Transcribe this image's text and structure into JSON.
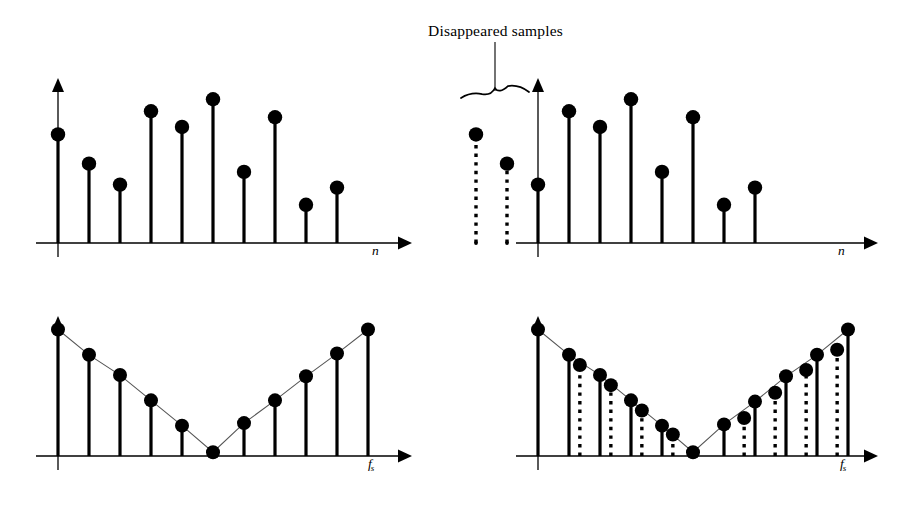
{
  "figure": {
    "background": "#ffffff",
    "ink": "#000000",
    "envelope_color": "#555555"
  },
  "annotations": {
    "disappeared_label": "Disappeared samples",
    "leader_line": {
      "x": 495,
      "y_top": 42,
      "y_bottom": 88
    },
    "brace": {
      "x_left": 461,
      "x_right": 529,
      "y": 98,
      "style": "horizontal-curly-underbrace"
    }
  },
  "axes": {
    "time_label": "n",
    "freq_label_base": "f",
    "freq_label_sub": "s"
  },
  "chart_data": [
    {
      "id": "top-left",
      "type": "stem",
      "title": "Original sampled sequence",
      "xlabel": "n",
      "ylabel": "",
      "origin": {
        "x": 58,
        "y": 243
      },
      "axis_end_x": 392,
      "y_axis_top": 82,
      "spacing": 31,
      "ylim": [
        0,
        1
      ],
      "grid": false,
      "legend": null,
      "categories": [
        0,
        1,
        2,
        3,
        4,
        5,
        6,
        7,
        8,
        9
      ],
      "values": [
        0.725,
        0.53,
        0.39,
        0.88,
        0.775,
        0.96,
        0.475,
        0.84,
        0.255,
        0.37
      ],
      "styles": [
        "solid",
        "solid",
        "solid",
        "solid",
        "solid",
        "solid",
        "solid",
        "solid",
        "solid",
        "solid"
      ]
    },
    {
      "id": "top-right",
      "type": "stem",
      "title": "Sequence with the first two samples disappeared",
      "xlabel": "n",
      "ylabel": "",
      "origin": {
        "x": 538,
        "y": 243
      },
      "axis_end_x": 858,
      "y_axis_top": 82,
      "spacing": 31,
      "ylim": [
        0,
        1
      ],
      "grid": false,
      "legend": null,
      "categories": [
        -2,
        -1,
        0,
        1,
        2,
        3,
        4,
        5,
        6,
        7
      ],
      "values": [
        0.725,
        0.53,
        0.39,
        0.88,
        0.775,
        0.96,
        0.475,
        0.84,
        0.255,
        0.37
      ],
      "styles": [
        "dotted",
        "dotted",
        "solid",
        "solid",
        "solid",
        "solid",
        "solid",
        "solid",
        "solid",
        "solid"
      ],
      "note": "The two left-most stems are drawn dotted — these are the disappeared samples."
    },
    {
      "id": "bottom-left",
      "type": "stem",
      "title": "Spectrum of the original sequence",
      "xlabel": "f_s",
      "ylabel": "",
      "origin": {
        "x": 58,
        "y": 456
      },
      "axis_end_x": 392,
      "y_axis_top": 320,
      "spacing": 31,
      "ylim": [
        0,
        1
      ],
      "grid": false,
      "legend": null,
      "envelope": {
        "shape": "V",
        "closing_line_at_fs": true
      },
      "categories": [
        0,
        1,
        2,
        3,
        4,
        5,
        6,
        7,
        8,
        9,
        10
      ],
      "values": [
        1.0,
        0.8,
        0.64,
        0.44,
        0.24,
        0.03,
        0.26,
        0.44,
        0.63,
        0.81,
        1.0
      ],
      "styles": [
        "solid",
        "solid",
        "solid",
        "solid",
        "solid",
        "solid",
        "solid",
        "solid",
        "solid",
        "solid",
        "solid"
      ]
    },
    {
      "id": "bottom-right",
      "type": "stem",
      "title": "Spectrum after the samples disappeared — extra components appear",
      "xlabel": "f_s",
      "ylabel": "",
      "origin": {
        "x": 538,
        "y": 456
      },
      "axis_end_x": 858,
      "y_axis_top": 320,
      "spacing": 31,
      "ylim": [
        0,
        1
      ],
      "grid": false,
      "legend": null,
      "envelope": {
        "shape": "V",
        "closing_line_at_fs": true
      },
      "categories": [
        0,
        1,
        1.35,
        2,
        2.35,
        3,
        3.35,
        4,
        4.35,
        5,
        6,
        6.65,
        7,
        7.65,
        8,
        8.65,
        9,
        9.65,
        10
      ],
      "values": [
        1.0,
        0.8,
        0.72,
        0.64,
        0.56,
        0.44,
        0.36,
        0.24,
        0.17,
        0.03,
        0.25,
        0.3,
        0.43,
        0.5,
        0.63,
        0.68,
        0.8,
        0.84,
        1.0
      ],
      "styles": [
        "solid",
        "solid",
        "dotted",
        "solid",
        "dotted",
        "solid",
        "dotted",
        "solid",
        "dotted",
        "solid",
        "solid",
        "dotted",
        "solid",
        "dotted",
        "solid",
        "dotted",
        "solid",
        "dotted",
        "solid"
      ],
      "note": "Solid and dotted stems alternate; the dotted ones are the spurious components created by the missing samples."
    }
  ]
}
